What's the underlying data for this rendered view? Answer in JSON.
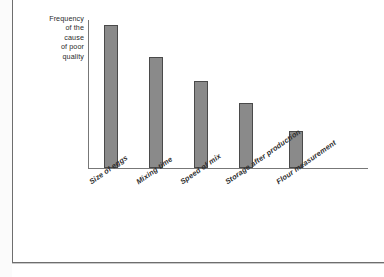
{
  "figure": {
    "background_color": "#ffffff",
    "frame_color": "#6e6e6e",
    "axis_color": "#777777"
  },
  "axis": {
    "y_title_lines": [
      "Frequency",
      "of the",
      "cause",
      "of poor",
      "quality"
    ],
    "y_title": "Frequency of the cause of poor quality"
  },
  "chart_data": {
    "type": "bar",
    "title": "",
    "subtitle": "",
    "xlabel": "",
    "ylabel": "Frequency of the cause of poor quality",
    "categories": [
      "Size of eggs",
      "Mixing time",
      "Speed of mix",
      "Storage after production",
      "Flour measurement"
    ],
    "values": [
      143,
      111,
      87,
      65,
      37
    ],
    "ylim": [
      0,
      150
    ],
    "grid": false,
    "legend": false,
    "axis_ticks": false,
    "tick_labels_rotated_deg": -35,
    "bar_fill_color": "#8a8a8a",
    "bar_edge_color": "#4a4a4a",
    "series": [
      {
        "name": "Frequency of the cause of poor quality",
        "values": [
          143,
          111,
          87,
          65,
          37
        ]
      }
    ]
  },
  "bars": [
    {
      "label": "Size of eggs",
      "value": 143,
      "left": 104,
      "top": 25,
      "width": 14,
      "height": 143
    },
    {
      "label": "Mixing time",
      "value": 111,
      "left": 149,
      "top": 57,
      "width": 14,
      "height": 111
    },
    {
      "label": "Speed of mix",
      "value": 87,
      "left": 194,
      "top": 81,
      "width": 14,
      "height": 87
    },
    {
      "label": "Storage after production",
      "value": 65,
      "left": 239,
      "top": 103,
      "width": 14,
      "height": 65
    },
    {
      "label": "Flour measurement",
      "value": 37,
      "left": 289,
      "top": 131,
      "width": 14,
      "height": 37
    }
  ],
  "xlabels": [
    {
      "text": "Size of eggs",
      "left": 90,
      "top": 178
    },
    {
      "text": "Mixing time",
      "left": 137,
      "top": 178
    },
    {
      "text": "Speed of mix",
      "left": 181,
      "top": 178
    },
    {
      "text": "Storage after production",
      "left": 226,
      "top": 178
    },
    {
      "text": "Flour measurement",
      "left": 277,
      "top": 178
    }
  ]
}
